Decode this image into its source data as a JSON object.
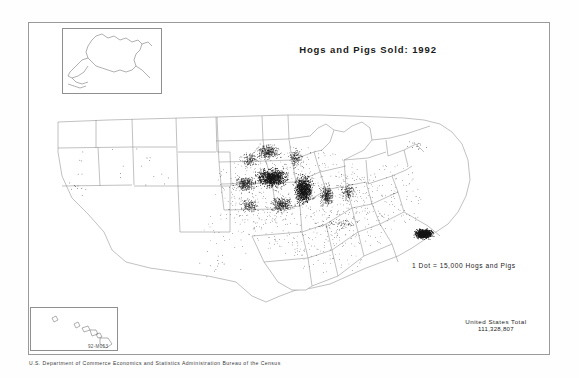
{
  "document": {
    "title": "Hogs and Pigs Sold: 1992",
    "map_code": "92-M053",
    "credit": "U.S. Department of Commerce   Economics and Statistics Administration   Bureau of the Census"
  },
  "legend": {
    "dot_value_text": "1 Dot = 15,000 Hogs and Pigs",
    "dot_value": 15000,
    "unit": "Hogs and Pigs"
  },
  "totals": {
    "label": "United States Total",
    "value": "111,328,807"
  },
  "insets": [
    {
      "name": "alaska",
      "label": "Alaska"
    },
    {
      "name": "hawaii",
      "label": "Hawaii"
    }
  ],
  "chart_data": {
    "type": "map",
    "subtype": "dot-density",
    "title": "Hogs and Pigs Sold: 1992",
    "dot_value": 15000,
    "units": "hogs and pigs sold",
    "national_total": 111328807,
    "source": "U.S. Department of Commerce, Economics and Statistics Administration, Bureau of the Census",
    "projection": "Albers equal area, conterminous United States with Alaska and Hawaii insets",
    "legend_text": "1 Dot = 15,000 Hogs and Pigs",
    "density_regions": [
      {
        "region": "Iowa",
        "density": "very high",
        "note": "densest core of the Corn Belt cluster"
      },
      {
        "region": "Illinois",
        "density": "very high"
      },
      {
        "region": "Minnesota (south)",
        "density": "high"
      },
      {
        "region": "Indiana",
        "density": "high"
      },
      {
        "region": "Nebraska (east)",
        "density": "high"
      },
      {
        "region": "Missouri (north)",
        "density": "high"
      },
      {
        "region": "Ohio (west)",
        "density": "moderate"
      },
      {
        "region": "North Carolina (coastal plain)",
        "density": "very high",
        "note": "isolated dense cluster in the Southeast"
      },
      {
        "region": "Kansas (east)",
        "density": "moderate"
      },
      {
        "region": "South Dakota (east)",
        "density": "moderate"
      },
      {
        "region": "Wisconsin",
        "density": "moderate"
      },
      {
        "region": "Kentucky / Tennessee",
        "density": "low"
      },
      {
        "region": "Texas",
        "density": "very low"
      },
      {
        "region": "Mountain West",
        "density": "very low"
      },
      {
        "region": "Pacific Coast",
        "density": "very low"
      },
      {
        "region": "New England",
        "density": "very low"
      },
      {
        "region": "Alaska",
        "density": "none"
      },
      {
        "region": "Hawaii",
        "density": "none"
      }
    ]
  }
}
